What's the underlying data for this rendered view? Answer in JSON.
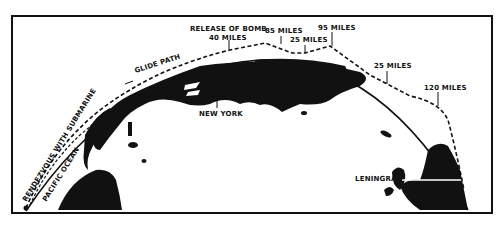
{
  "diagram": {
    "type": "flight-path-over-globe",
    "colors": {
      "ink": "#111111",
      "background": "#ffffff"
    },
    "path_labels": {
      "release_of_bomb": "RELEASE OF BOMB",
      "altitude_release": "40 MILES",
      "altitude_peak_1": "85 MILES",
      "altitude_dip_1": "25 MILES",
      "altitude_peak_2": "95 MILES",
      "altitude_dip_2": "25 MILES",
      "altitude_final": "120 MILES",
      "glide_path": "GLIDE PATH",
      "rendezvous": "RENDEZVOUS WITH SUBMARINE"
    },
    "place_labels": {
      "pacific_ocean": "PACIFIC OCEAN",
      "new_york": "NEW YORK",
      "leningrad": "LENINGRAD"
    }
  }
}
